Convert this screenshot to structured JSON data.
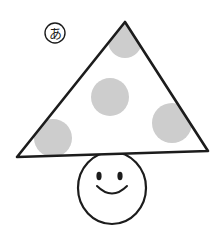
{
  "figure": {
    "background_color": "#ffffff",
    "ink_color": "#1c1c1c",
    "spot_fill_color": "#cdcdcd",
    "label": {
      "name": "circled-hiragana-a",
      "text": "あ",
      "circled_text": "あ",
      "center_x": 55,
      "center_y": 33,
      "circle_radius": 10
    },
    "cap": {
      "name": "triangle-mushroom-cap",
      "shape": "triangle",
      "apex_x": 125,
      "apex_y": 22,
      "bottom_left_x": 17,
      "bottom_left_y": 157,
      "bottom_right_x": 208,
      "bottom_right_y": 151,
      "stroke_width": 2.6,
      "fill": "#ffffff"
    },
    "spots": [
      {
        "name": "spot-top",
        "cx": 125,
        "cy": 41,
        "r": 17
      },
      {
        "name": "spot-center",
        "cx": 110,
        "cy": 97,
        "r": 19
      },
      {
        "name": "spot-bottom-left",
        "cx": 53,
        "cy": 138,
        "r": 19
      },
      {
        "name": "spot-bottom-right",
        "cx": 172,
        "cy": 123,
        "r": 20
      }
    ],
    "head": {
      "name": "mushroom-head-face",
      "cx": 112,
      "cy": 188,
      "rx": 34,
      "ry": 36,
      "top_y": 152,
      "bottom_y": 223,
      "stroke_width": 2.2,
      "fill": "#ffffff"
    },
    "eyes": [
      {
        "name": "eye-left",
        "cx": 99,
        "cy": 176,
        "rx": 2.6,
        "ry": 4.2
      },
      {
        "name": "eye-right",
        "cx": 120,
        "cy": 176,
        "rx": 2.6,
        "ry": 4.2
      }
    ],
    "mouth": {
      "name": "mouth-smile",
      "start_x": 97,
      "start_y": 186,
      "end_x": 127,
      "end_y": 186,
      "control_x": 112,
      "control_y": 201,
      "stroke_width": 2.0
    }
  }
}
